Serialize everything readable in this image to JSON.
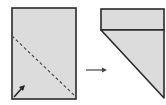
{
  "diagram": {
    "steps": [
      {
        "name": "unfolded-sheet",
        "fold_line": "diagonal dashed",
        "fold_arrow": "bottom-left toward upper-right"
      },
      {
        "name": "folded-result",
        "shape": "top band with triangle"
      }
    ],
    "transition_arrow": "right",
    "colors": {
      "paper": "#dcdcdc",
      "outline": "#2a2a2a",
      "dash": "#555555"
    }
  }
}
